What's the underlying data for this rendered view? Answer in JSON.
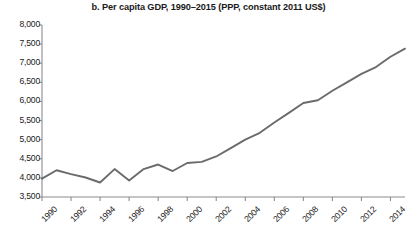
{
  "chart_data": {
    "type": "line",
    "title": "b. Per capita GDP, 1990–2015 (PPP, constant 2011 US$)",
    "xlabel": "",
    "ylabel": "",
    "ylim": [
      3500,
      8000
    ],
    "xlim": [
      1990,
      2015
    ],
    "ytick_step": 500,
    "xtick_step": 2,
    "grid": false,
    "legend": null,
    "line_color": "#6b6b6b",
    "axis_color": "#8c8c8c",
    "y_ticks": [
      3500,
      4000,
      4500,
      5000,
      5500,
      6000,
      6500,
      7000,
      7500,
      8000
    ],
    "y_tick_labels": [
      "3,500",
      "4,000",
      "4,500",
      "5,000",
      "5,500",
      "6,000",
      "6,500",
      "7,000",
      "7,500",
      "8,000"
    ],
    "x_ticks": [
      1990,
      1992,
      1994,
      1996,
      1998,
      2000,
      2002,
      2004,
      2006,
      2008,
      2010,
      2012,
      2014
    ],
    "x_tick_labels": [
      "1990",
      "1992",
      "1994",
      "1996",
      "1998",
      "2000",
      "2002",
      "2004",
      "2006",
      "2008",
      "2010",
      "2012",
      "2014"
    ],
    "x": [
      1990,
      1991,
      1992,
      1993,
      1994,
      1995,
      1996,
      1997,
      1998,
      1999,
      2000,
      2001,
      2002,
      2003,
      2004,
      2005,
      2006,
      2007,
      2008,
      2009,
      2010,
      2011,
      2012,
      2013,
      2014,
      2015
    ],
    "values": [
      3980,
      4200,
      4100,
      4010,
      3880,
      4230,
      3930,
      4230,
      4350,
      4180,
      4390,
      4420,
      4560,
      4780,
      5000,
      5180,
      5450,
      5700,
      5960,
      6030,
      6280,
      6500,
      6720,
      6900,
      7170,
      7380
    ],
    "series": [
      {
        "name": "Per capita GDP",
        "values": [
          3980,
          4200,
          4100,
          4010,
          3880,
          4230,
          3930,
          4230,
          4350,
          4180,
          4390,
          4420,
          4560,
          4780,
          5000,
          5180,
          5450,
          5700,
          5960,
          6030,
          6280,
          6500,
          6720,
          6900,
          7170,
          7380
        ]
      }
    ]
  },
  "plot_geometry": {
    "left": 42,
    "right": 405,
    "top": 25,
    "bottom": 197
  }
}
